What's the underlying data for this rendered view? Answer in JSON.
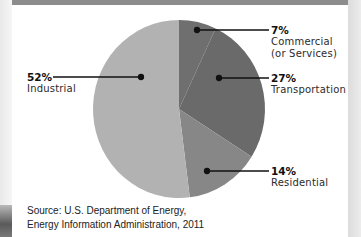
{
  "chart_data": {
    "type": "pie",
    "title": "",
    "slices": [
      {
        "label": "Commercial (or Services)",
        "value": 7,
        "display": "7%",
        "color": "#6f6f6f"
      },
      {
        "label": "Transportation",
        "value": 27,
        "display": "27%",
        "color": "#6a6a6a"
      },
      {
        "label": "Residential",
        "value": 14,
        "display": "14%",
        "color": "#878787"
      },
      {
        "label": "Industrial",
        "value": 52,
        "display": "52%",
        "color": "#b2b2b2"
      }
    ],
    "legend_position": "callouts"
  },
  "labels": {
    "commercial": {
      "pct": "7%",
      "line1": "Commercial",
      "line2": "(or Services)"
    },
    "transportation": {
      "pct": "27%",
      "line1": "Transportation"
    },
    "residential": {
      "pct": "14%",
      "line1": "Residential"
    },
    "industrial": {
      "pct": "52%",
      "line1": "Industrial"
    }
  },
  "source": {
    "line1": "Source: U.S. Department of Energy,",
    "line2": "Energy Information Administration, 2011"
  },
  "colors": {
    "top_bar": "#8c8c8c",
    "commercial": "#6f6f6f",
    "transportation": "#6a6a6a",
    "residential": "#878787",
    "industrial": "#b2b2b2"
  }
}
